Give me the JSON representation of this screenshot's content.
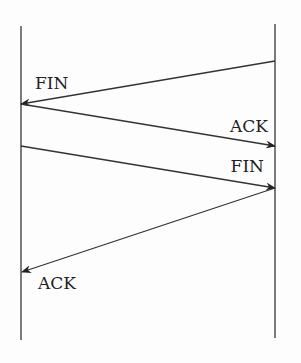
{
  "diagram": {
    "type": "sequence",
    "endpoints": [
      {
        "name": "left",
        "x": 21,
        "y1": 26,
        "y2": 340
      },
      {
        "name": "right",
        "x": 275,
        "y1": 24,
        "y2": 338
      }
    ],
    "messages": [
      {
        "label": "FIN",
        "from": "right",
        "to": "left",
        "x1": 275,
        "y1": 61,
        "x2": 21,
        "y2": 104,
        "label_x": 35,
        "label_y": 89,
        "anchor": "start"
      },
      {
        "label": "ACK",
        "from": "left",
        "to": "right",
        "x1": 21,
        "y1": 104,
        "x2": 275,
        "y2": 146,
        "label_x": 268,
        "label_y": 132,
        "anchor": "end"
      },
      {
        "label": "FIN",
        "from": "left",
        "to": "right",
        "x1": 21,
        "y1": 146,
        "x2": 275,
        "y2": 188,
        "label_x": 264,
        "label_y": 172,
        "anchor": "end"
      },
      {
        "label": "ACK",
        "from": "right",
        "to": "left",
        "x1": 275,
        "y1": 188,
        "x2": 22,
        "y2": 272,
        "label_x": 38,
        "label_y": 289,
        "anchor": "start"
      }
    ],
    "colors": {
      "line": "#333333",
      "text": "#222222",
      "background": "#fdfdfd"
    }
  }
}
